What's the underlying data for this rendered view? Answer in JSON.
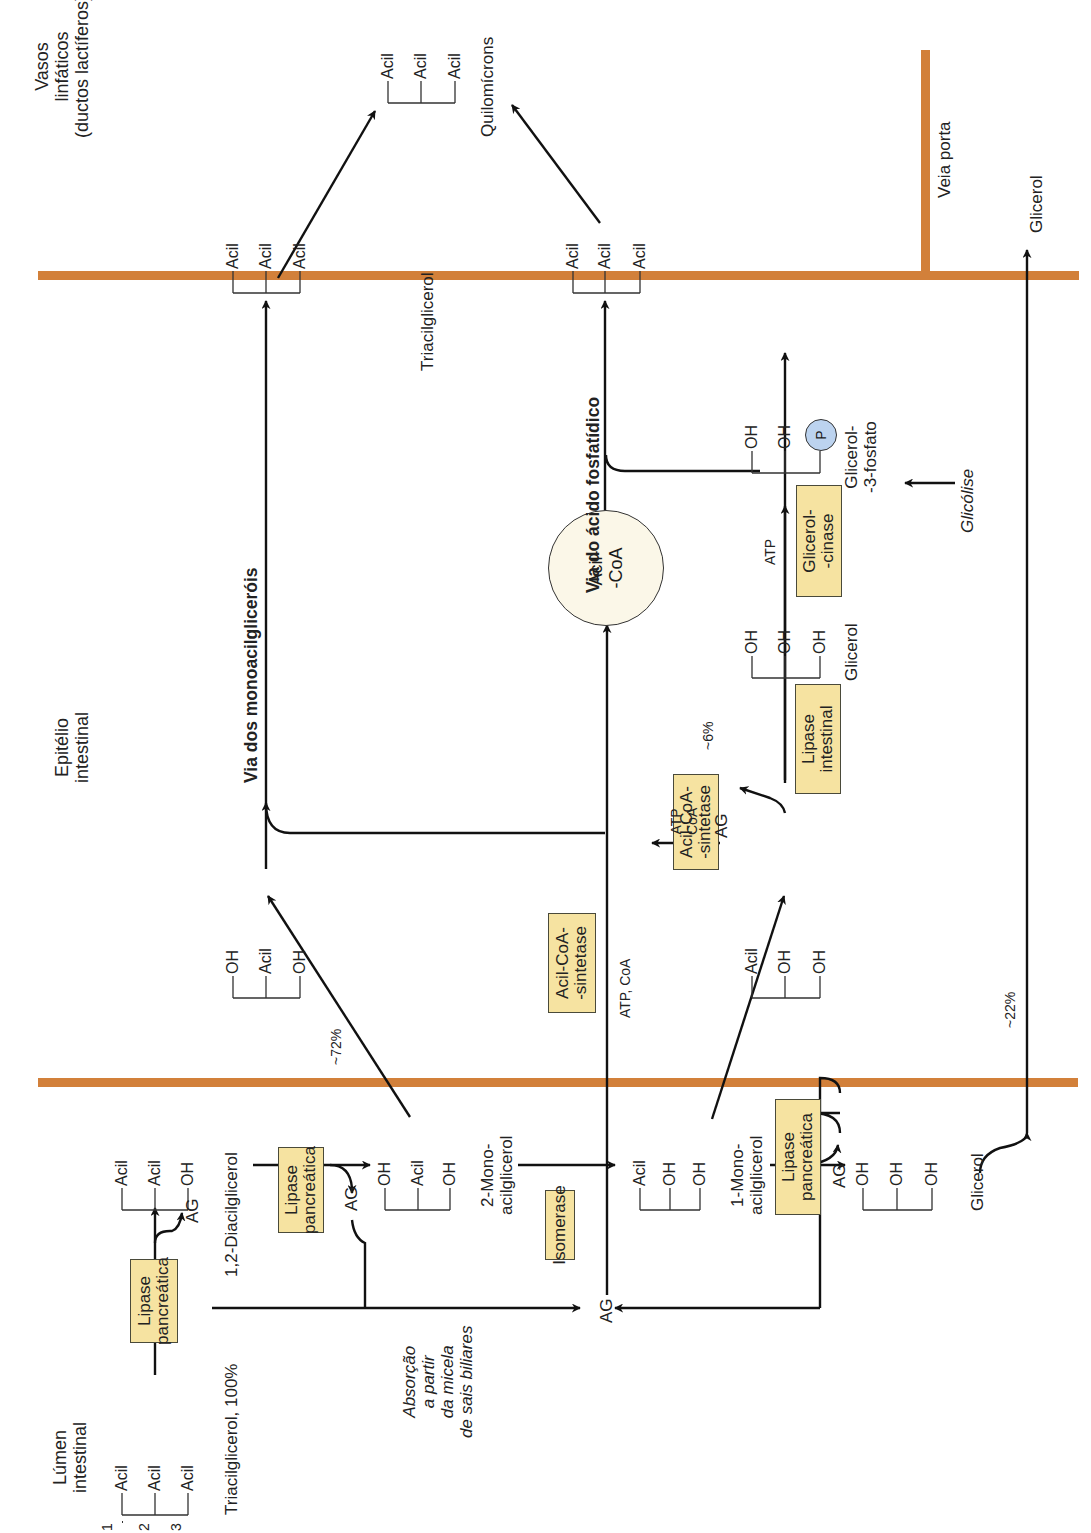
{
  "regions": {
    "lumen": "Lúmen\nintestinal",
    "epithelium": "Epitélio\nintestinal",
    "lymphatic": "Vasos\nlinfáticos\n(ductos lactíferos)",
    "portal_vein": "Veia porta"
  },
  "colors": {
    "membrane": "#d2803a",
    "enzyme_fill": "#f6e3a1",
    "acylcoa_fill": "#fbf7e8",
    "phosphate_fill": "#bcd3ef",
    "line": "#111111"
  },
  "enzymes": {
    "lipase_pancreatic_1": "Lipase\npancreática",
    "lipase_pancreatic_2": "Lipase\npancreática",
    "lipase_pancreatic_3": "Lipase\npancreática",
    "isomerase": "Isomerase",
    "acylcoa_synthetase_1": "Acil-CoA-\n-sintetase",
    "acylcoa_synthetase_2": "Acil-CoA-\n-sintetase",
    "lipase_intestinal": "Lipase\nintestinal",
    "glycerol_kinase": "Glicerol-\n-cinase"
  },
  "molecules": {
    "tag_lumen": {
      "groups": [
        "Acil",
        "Acil",
        "Acil"
      ],
      "positions": [
        "1",
        "2",
        "3"
      ],
      "label": "Triacilglicerol, 100%"
    },
    "dag_top": {
      "groups": [
        "Acil",
        "Acil",
        "OH"
      ]
    },
    "dag_label": "1,2-Diacilglicerol",
    "mag2_lumen": {
      "groups": [
        "OH",
        "Acil",
        "OH"
      ],
      "label": "2-Mono-\nacilglicerol"
    },
    "mag1_lumen": {
      "groups": [
        "Acil",
        "OH",
        "OH"
      ],
      "label": "1-Mono-\nacilglicerol"
    },
    "glycerol_lumen": {
      "groups": [
        "OH",
        "OH",
        "OH"
      ],
      "label": "Glicerol"
    },
    "mag2_epi": {
      "groups": [
        "OH",
        "Acil",
        "OH"
      ]
    },
    "mag1_epi": {
      "groups": [
        "Acil",
        "OH",
        "OH"
      ]
    },
    "glycerol_epi": {
      "groups": [
        "OH",
        "OH",
        "OH"
      ],
      "label": "Glicerol"
    },
    "g3p": {
      "groups": [
        "OH",
        "OH",
        "P"
      ],
      "label": "Glicerol-\n-3-fosfato"
    },
    "tag_epi_top": {
      "groups": [
        "Acil",
        "Acil",
        "Acil"
      ]
    },
    "tag_epi_bottom": {
      "groups": [
        "Acil",
        "Acil",
        "Acil"
      ]
    },
    "tag_epi_label": "Triacilglicerol",
    "tag_lymph": {
      "groups": [
        "Acil",
        "Acil",
        "Acil"
      ],
      "label": "Quilomícrons"
    },
    "acylcoa": "Acil-\n-CoA"
  },
  "labels": {
    "ag_1": "AG",
    "ag_2": "AG",
    "ag_center": "AG",
    "ag_3": "AG",
    "ag_epi": "AG",
    "absorption": "Absorção\na partir\nda micela\nde sais biliares",
    "pct_72": "~72%",
    "pct_6": "~6%",
    "pct_22": "~22%",
    "atp_coa_1": "ATP, CoA",
    "atp_coa_2": "ATP\nCoA",
    "atp": "ATP",
    "glycolysis": "Glicólise",
    "glycerol_portal": "Glicerol",
    "pathway_mag": "Via dos monoacilgliceróis",
    "pathway_pa": "Via do ácido fosfatídico"
  }
}
